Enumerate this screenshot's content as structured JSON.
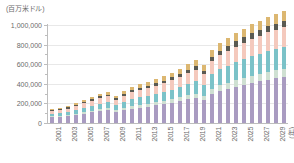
{
  "unit_label": "(百万米ドル)",
  "x_unit_label": "(年)",
  "colors": {
    "series1": "#a99bc1",
    "series2": "#cfe0d2",
    "series3": "#7bc2c8",
    "series4": "#f4c9bd",
    "series5": "#5a5a52",
    "series6": "#dcb771",
    "gridline": "#e8e8e8",
    "axis": "#bdbdbd",
    "text": "#6b6b6b"
  },
  "chart_data": {
    "type": "bar",
    "title": "",
    "xlabel": "(年)",
    "ylabel": "(百万米ドル)",
    "ylim": [
      0,
      1000000
    ],
    "ytick_labels": [
      "1,000,000",
      "800,000",
      "600,000",
      "400,000",
      "200,000",
      "0"
    ],
    "ytick_values": [
      1000000,
      800000,
      600000,
      400000,
      200000,
      0
    ],
    "grid": true,
    "stacked": true,
    "legend": "none",
    "categories": [
      "2001",
      "2002",
      "2003",
      "2004",
      "2005",
      "2006",
      "2007",
      "2008",
      "2009",
      "2010",
      "2011",
      "2012",
      "2013",
      "2014",
      "2015",
      "2016",
      "2017",
      "2018",
      "2019",
      "2020",
      "2021",
      "2022",
      "2023",
      "2024",
      "2025",
      "2026",
      "2027",
      "2028",
      "2029",
      "2030"
    ],
    "xtick_labels_shown": [
      "2001",
      "2003",
      "2005",
      "2007",
      "2009",
      "2011",
      "2013",
      "2015",
      "2017",
      "2019",
      "2021",
      "2023",
      "2025",
      "2027",
      "2029"
    ],
    "series": [
      {
        "name": "series1",
        "color": "#a99bc1",
        "values": [
          58000,
          62000,
          70000,
          82000,
          95000,
          108000,
          120000,
          128000,
          112000,
          132000,
          148000,
          158000,
          168000,
          180000,
          190000,
          205000,
          222000,
          240000,
          255000,
          235000,
          300000,
          330000,
          352000,
          372000,
          392000,
          410000,
          428000,
          444000,
          458000,
          470000
        ]
      },
      {
        "name": "series2",
        "color": "#cfe0d2",
        "values": [
          10000,
          11000,
          12000,
          14000,
          16000,
          18000,
          20000,
          22000,
          19000,
          23000,
          26000,
          28000,
          30000,
          32000,
          34000,
          36000,
          39000,
          42000,
          45000,
          41000,
          52000,
          57000,
          61000,
          65000,
          68000,
          71000,
          74000,
          77000,
          79000,
          81000
        ]
      },
      {
        "name": "series3",
        "color": "#7bc2c8",
        "values": [
          26000,
          28000,
          32000,
          38000,
          44000,
          50000,
          56000,
          60000,
          52000,
          62000,
          70000,
          75000,
          80000,
          86000,
          92000,
          99000,
          107000,
          116000,
          124000,
          114000,
          146000,
          160000,
          171000,
          181000,
          190000,
          199000,
          207000,
          215000,
          222000,
          228000
        ]
      },
      {
        "name": "series4",
        "color": "#f4c9bd",
        "values": [
          28000,
          30000,
          34000,
          39000,
          45000,
          51000,
          57000,
          61000,
          53000,
          62000,
          70000,
          74000,
          79000,
          84000,
          89000,
          95000,
          102000,
          110000,
          117000,
          108000,
          134000,
          146000,
          155000,
          163000,
          170000,
          177000,
          183000,
          189000,
          194000,
          198000
        ]
      },
      {
        "name": "series5",
        "color": "#5a5a52",
        "values": [
          9000,
          10000,
          11000,
          13000,
          15000,
          17000,
          19000,
          20000,
          17000,
          20000,
          23000,
          24000,
          26000,
          27000,
          29000,
          31000,
          33000,
          36000,
          38000,
          35000,
          44000,
          47000,
          50000,
          53000,
          55000,
          57000,
          59000,
          61000,
          62000,
          64000
        ]
      },
      {
        "name": "series6",
        "color": "#dcb771",
        "values": [
          13000,
          14000,
          16000,
          19000,
          22000,
          25000,
          28000,
          30000,
          26000,
          31000,
          35000,
          37000,
          39000,
          42000,
          45000,
          48000,
          52000,
          56000,
          60000,
          55000,
          68000,
          74000,
          79000,
          84000,
          88000,
          92000,
          95000,
          98000,
          101000,
          103000
        ]
      }
    ]
  }
}
